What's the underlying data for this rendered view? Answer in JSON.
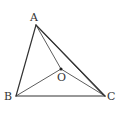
{
  "diagram": {
    "type": "geometry-triangle",
    "points": {
      "A": {
        "label": "A",
        "x": 36,
        "y": 25
      },
      "B": {
        "label": "B",
        "x": 16,
        "y": 96
      },
      "C": {
        "label": "C",
        "x": 105,
        "y": 96
      },
      "O": {
        "label": "O",
        "x": 61,
        "y": 69
      }
    },
    "segments": [
      [
        "A",
        "B"
      ],
      [
        "B",
        "C"
      ],
      [
        "A",
        "C"
      ],
      [
        "A",
        "O"
      ],
      [
        "B",
        "O"
      ],
      [
        "C",
        "O"
      ],
      [
        "A",
        "C"
      ]
    ],
    "colors": {
      "stroke": "#333333",
      "background": "#ffffff"
    }
  }
}
